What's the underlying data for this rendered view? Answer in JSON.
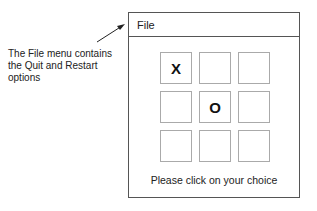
{
  "annotation": {
    "lines": [
      "The File menu contains",
      "the Quit and Restart",
      "options"
    ]
  },
  "window": {
    "menu": {
      "file_label": "File"
    },
    "board": {
      "cells": [
        "X",
        "",
        "",
        "",
        "O",
        "",
        "",
        "",
        ""
      ]
    },
    "status_text": "Please click on your choice"
  }
}
